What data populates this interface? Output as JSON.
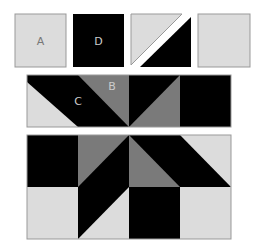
{
  "colors": {
    "light": "#dcdcdc",
    "dark": "#000000",
    "gray": "#7a7a7a",
    "border": "#999999",
    "label_on_light": "#777777",
    "label_on_dark": "#cccccc"
  },
  "pieces": {
    "a": {
      "label": "A"
    },
    "d": {
      "label": "D"
    },
    "half_square": {
      "label": ""
    },
    "plain": {
      "label": ""
    }
  },
  "strip": {
    "label_c": "C",
    "label_b": "B"
  }
}
